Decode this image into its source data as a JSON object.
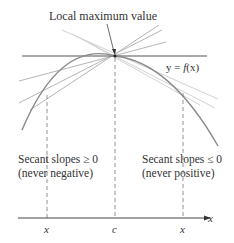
{
  "figure": {
    "title_label": "Local maximum value",
    "curve_label_prefix": "y = ",
    "curve_label_func": "f",
    "curve_label_arg": "(x)",
    "left_note_line1": "Secant slopes ≥ 0",
    "left_note_line2": "(never negative)",
    "right_note_line1": "Secant slopes ≤ 0",
    "right_note_line2": "(never positive)",
    "axis_label": "x",
    "tick_labels": [
      "x",
      "c",
      "x"
    ],
    "colors": {
      "curve": "#8a8a8a",
      "tangent": "#555555",
      "secant_dark": "#9a9a9a",
      "secant_light": "#cfcfcf",
      "axis": "#444444",
      "text": "#333333"
    }
  }
}
